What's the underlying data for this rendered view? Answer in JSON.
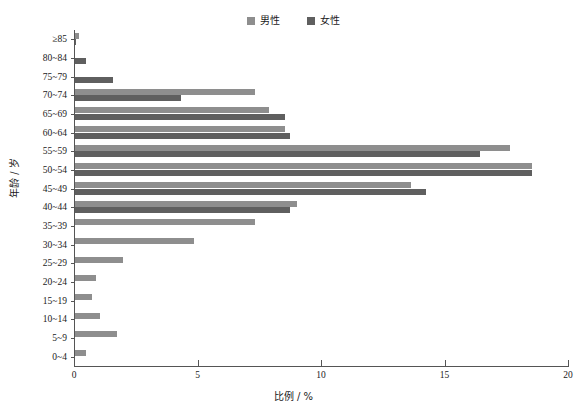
{
  "chart_data": {
    "type": "bar",
    "orientation": "horizontal",
    "title": "",
    "xlabel": "比例 / %",
    "ylabel": "年龄 / 岁",
    "xlim": [
      0,
      20
    ],
    "xticks": [
      "0",
      "5",
      "10",
      "15",
      "20"
    ],
    "grid": false,
    "legend_position": "top-center",
    "categories": [
      "≥85",
      "80~84",
      "75~79",
      "70~74",
      "65~69",
      "60~64",
      "55~59",
      "50~54",
      "45~49",
      "40~44",
      "35~39",
      "30~34",
      "25~29",
      "20~24",
      "15~19",
      "10~14",
      "5~9",
      "0~4"
    ],
    "series": [
      {
        "name": "男性",
        "color": "#8e8e8e",
        "values": [
          0.15,
          0.0,
          0.0,
          7.3,
          7.85,
          8.5,
          17.6,
          18.5,
          13.6,
          9.0,
          7.3,
          4.8,
          1.95,
          0.85,
          0.7,
          1.0,
          1.7,
          0.45
        ]
      },
      {
        "name": "女性",
        "color": "#5f5f5f",
        "values": [
          0.05,
          0.45,
          1.55,
          4.3,
          8.5,
          8.7,
          16.4,
          18.5,
          14.2,
          8.7,
          0.0,
          0.0,
          0.0,
          0.0,
          0.0,
          0.0,
          0.0,
          0.0
        ]
      }
    ]
  },
  "legend": {
    "entries": [
      {
        "label": "男性",
        "color": "#8e8e8e"
      },
      {
        "label": "女性",
        "color": "#5f5f5f"
      }
    ]
  },
  "axes": {
    "x_title": "比例 / %",
    "y_title": "年龄 / 岁",
    "x_tick_labels": [
      "0",
      "5",
      "10",
      "15",
      "20"
    ]
  },
  "colors": {
    "male": "#8e8e8e",
    "female": "#5f5f5f",
    "axis": "#555555",
    "background": "#ffffff",
    "text": "#1a1a1a"
  }
}
